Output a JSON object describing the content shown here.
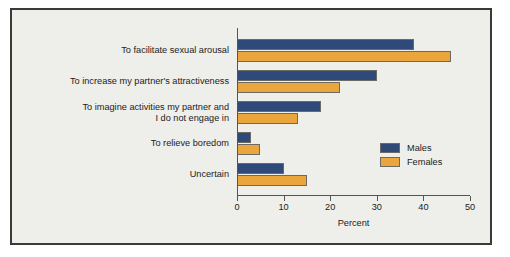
{
  "chart_data": {
    "type": "bar",
    "orientation": "horizontal",
    "title": "",
    "subtitle": "",
    "xlabel": "Percent",
    "ylabel": "",
    "xlim": [
      0,
      50
    ],
    "xticks": [
      0,
      10,
      20,
      30,
      40,
      50
    ],
    "xtick_labels": [
      "0",
      "10",
      "20",
      "30",
      "40",
      "50"
    ],
    "grid": false,
    "legend_position": "inside-right",
    "categories": [
      "To facilitate sexual arousal",
      "To increase my partner's attractiveness",
      "To imagine activities my partner and\nI do not engage in",
      "To relieve boredom",
      "Uncertain"
    ],
    "series": [
      {
        "name": "Males",
        "color": "#2f4a79",
        "values": [
          38,
          30,
          18,
          3,
          10
        ]
      },
      {
        "name": "Females",
        "color": "#eaa63c",
        "values": [
          46,
          22,
          13,
          5,
          15
        ]
      }
    ]
  },
  "colors": {
    "males": "#2f4a79",
    "females": "#eaa63c",
    "plot_background": "#eeeeea",
    "frame_border": "#3a3a38",
    "axis_line": "#55554f",
    "text": "#1c1c1c"
  }
}
